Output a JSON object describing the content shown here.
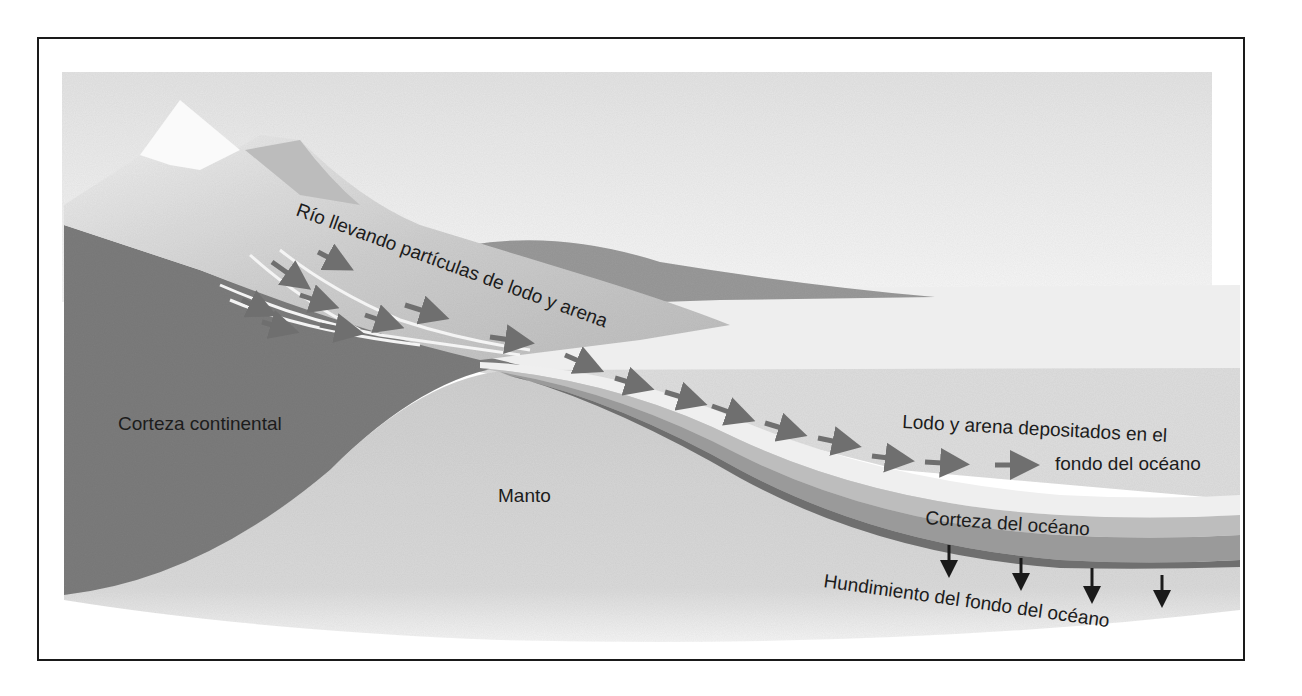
{
  "diagram": {
    "type": "geological cross-section",
    "colors": {
      "sky": "#e6e6e6",
      "mountain_light": "#c9c9c9",
      "mountain_snow": "#f2f2f2",
      "continental_crust": "#7d7d7d",
      "mantle": "#d3d3d3",
      "ocean": "#dcdcdc",
      "sediment": "#ececec",
      "ocean_crust_light": "#a8a8a8",
      "ocean_crust_dark": "#7a7a7a",
      "arrow_gray": "#6f6f6f",
      "arrow_black": "#1a1a1a",
      "frame": "#1a1a1a"
    },
    "labels": {
      "river": "Río llevando partículas de lodo y arena",
      "continental_crust": "Corteza continental",
      "mantle": "Manto",
      "deposits_line1": "Lodo y arena depositados en el",
      "deposits_line2": "fondo del océano",
      "ocean_crust": "Corteza del océano",
      "subsidence": "Hundimiento del fondo del océano"
    },
    "arrows": {
      "river_flow_count": 16,
      "subsidence_count": 4
    }
  }
}
